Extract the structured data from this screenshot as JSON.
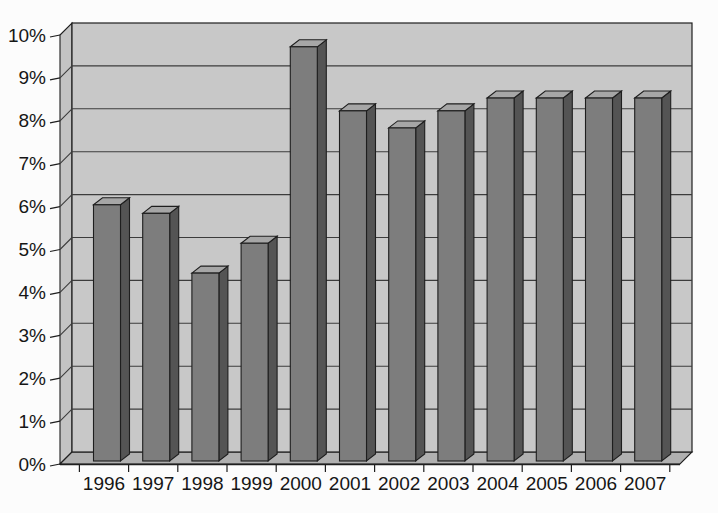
{
  "page": {
    "background": "#fcfcfc",
    "title": ""
  },
  "chart_data": {
    "type": "bar",
    "style": "3d-column-grayscale",
    "title": "",
    "xlabel": "",
    "ylabel": "",
    "categories": [
      "1996",
      "1997",
      "1998",
      "1999",
      "2000",
      "2001",
      "2002",
      "2003",
      "2004",
      "2005",
      "2006",
      "2007"
    ],
    "values": [
      6.0,
      5.8,
      4.4,
      5.1,
      9.7,
      8.2,
      7.8,
      8.2,
      8.5,
      8.5,
      8.5,
      8.5
    ],
    "unit": "%",
    "ylim": [
      0,
      10
    ],
    "y_tick_step": 1,
    "y_tick_labels": [
      "0%",
      "1%",
      "2%",
      "3%",
      "4%",
      "5%",
      "6%",
      "7%",
      "8%",
      "9%",
      "10%"
    ],
    "grid": true,
    "legend_position": "none",
    "colors": {
      "wall": "#c8c8c8",
      "left_wall": "#c3c3c3",
      "floor": "#b0b0b0",
      "bar_front": "#7d7d7d",
      "bar_side": "#545454",
      "bar_top": "#a6a6a6",
      "outline": "#1e1e1e",
      "gridline": "#3c3c3c",
      "text": "#161616",
      "background": "#fcfcfc"
    }
  }
}
